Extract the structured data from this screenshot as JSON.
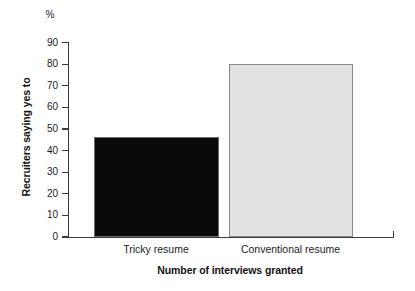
{
  "chart_data": {
    "type": "bar",
    "title": "",
    "subtitle": "",
    "categories": [
      "Tricky resume",
      "Conventional resume"
    ],
    "values": [
      46.5,
      80
    ],
    "series": [
      {
        "name": "Recruiters saying yes to",
        "values": [
          46.5,
          80
        ]
      }
    ],
    "xlabel": "Number of interviews granted",
    "ylabel": "Recruiters saying yes to",
    "yunit": "%",
    "ylim": [
      0,
      90
    ],
    "ytick_step": 10,
    "yticks": [
      0,
      10,
      20,
      30,
      40,
      50,
      60,
      70,
      80,
      90
    ],
    "ytick_labels": [
      "0",
      "10",
      "20",
      "30",
      "40",
      "50",
      "60",
      "70",
      "80",
      "90"
    ],
    "grid": false,
    "legend": false,
    "legend_position": "none",
    "bar_colors": [
      "#0a0a0a",
      "#e2e2e2"
    ],
    "annotations": []
  },
  "axis": {
    "y_unit_label": "%",
    "y_axis_title": "Recruiters saying yes to",
    "x_axis_title": "Number of interviews granted"
  },
  "colors": {
    "background": "#ffffff",
    "axis": "#3a3a3a",
    "text": "#1d1d1d",
    "bar_dark": "#0a0a0a",
    "bar_light": "#e2e2e2",
    "bar_border": "#8b8b8b"
  }
}
